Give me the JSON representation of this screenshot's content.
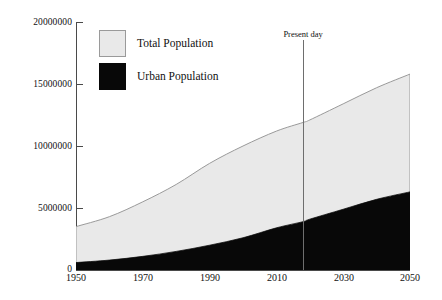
{
  "chart_data": {
    "type": "area",
    "stacked": true,
    "title": "",
    "subtitle": "",
    "xlabel": "",
    "ylabel": "",
    "x": [
      1950,
      1960,
      1970,
      1980,
      1990,
      2000,
      2010,
      2018,
      2020,
      2030,
      2040,
      2050
    ],
    "xlim": [
      1950,
      2050
    ],
    "ylim": [
      0,
      20000000
    ],
    "xticks": [
      "1950",
      "1970",
      "1990",
      "2010",
      "2030",
      "2050"
    ],
    "xtick_values": [
      1950,
      1970,
      1990,
      2010,
      2030,
      2050
    ],
    "yticks": [
      "0",
      "5000000",
      "10000000",
      "15000000",
      "20000000"
    ],
    "ytick_values": [
      0,
      5000000,
      10000000,
      15000000,
      20000000
    ],
    "grid": false,
    "legend_position": "top-left",
    "series": [
      {
        "name": "Total Population",
        "color": "#e9e9e9",
        "border_color": "#9a9a9a",
        "values": [
          3500000,
          4300000,
          5500000,
          6900000,
          8600000,
          10000000,
          11200000,
          11900000,
          12100000,
          13400000,
          14700000,
          15800000
        ]
      },
      {
        "name": "Urban Population",
        "color": "#080808",
        "border_color": "#080808",
        "values": [
          600000,
          800000,
          1100000,
          1500000,
          2000000,
          2600000,
          3400000,
          3900000,
          4100000,
          4900000,
          5700000,
          6300000
        ]
      }
    ],
    "annotations": [
      {
        "label": "Present day",
        "x": 2018,
        "type": "vertical-line",
        "color": "#6e6e6e"
      }
    ]
  },
  "legend": {
    "items": [
      {
        "label": "Total Population",
        "swatch": "total-population-swatch"
      },
      {
        "label": "Urban Population",
        "swatch": "urban-population-swatch"
      }
    ]
  },
  "axes": {
    "y_labels": [
      "20000000",
      "15000000",
      "10000000",
      "5000000",
      "0"
    ],
    "x_labels": [
      "1950",
      "1970",
      "1990",
      "2010",
      "2030",
      "2050"
    ]
  },
  "annotation": {
    "present_day_label": "Present day"
  }
}
